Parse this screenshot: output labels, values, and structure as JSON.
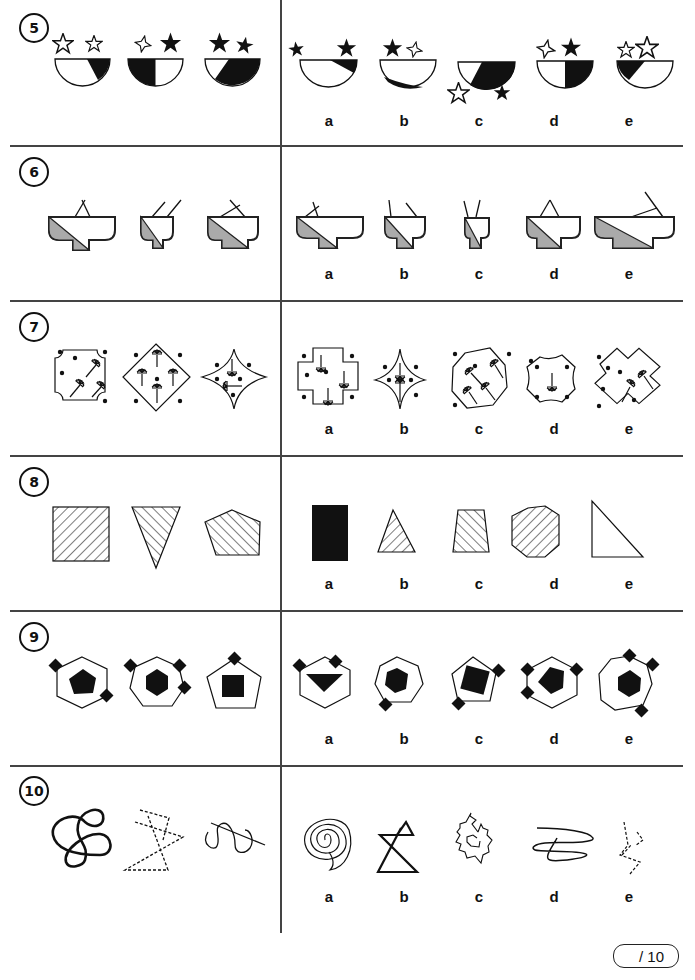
{
  "worksheet": {
    "questions": [
      {
        "number": "5",
        "description": "Bowls half-shaded with two stars above",
        "options": [
          "a",
          "b",
          "c",
          "d",
          "e"
        ]
      },
      {
        "number": "6",
        "description": "Stepped bowl shapes with grey diagonal shading and lines",
        "options": [
          "a",
          "b",
          "c",
          "d",
          "e"
        ]
      },
      {
        "number": "7",
        "description": "Shapes with dots and lollipop-like lines",
        "options": [
          "a",
          "b",
          "c",
          "d",
          "e"
        ]
      },
      {
        "number": "8",
        "description": "Hatched polygons",
        "options": [
          "a",
          "b",
          "c",
          "d",
          "e"
        ]
      },
      {
        "number": "9",
        "description": "Outlined polygons with black inner shape and black diamonds",
        "options": [
          "a",
          "b",
          "c",
          "d",
          "e"
        ]
      },
      {
        "number": "10",
        "description": "Line drawings: curves, dashed zigzags, spirals",
        "options": [
          "a",
          "b",
          "c",
          "d",
          "e"
        ]
      }
    ],
    "score": {
      "label": "/ 10"
    }
  }
}
